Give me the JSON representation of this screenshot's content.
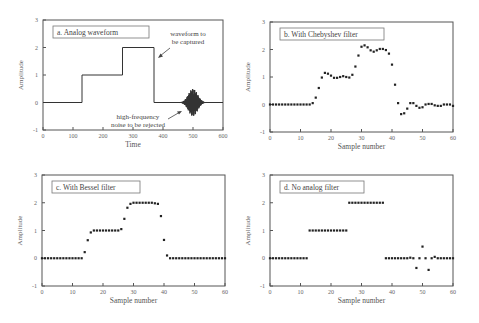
{
  "chart_data": [
    {
      "id": "a",
      "type": "line",
      "title": "a. Analog waveform",
      "xlabel": "Time",
      "ylabel": "Amplitude",
      "xlim": [
        0,
        600
      ],
      "ylim": [
        -1,
        3
      ],
      "xticks": [
        0,
        100,
        200,
        300,
        400,
        500,
        600
      ],
      "yticks": [
        -1,
        0,
        1,
        2,
        3
      ],
      "grid": false,
      "step_waveform": {
        "x": [
          0,
          130,
          130,
          265,
          265,
          370,
          370,
          600
        ],
        "y": [
          0,
          0,
          1,
          1,
          2,
          2,
          0,
          0
        ]
      },
      "noise_burst": {
        "center": 500,
        "halfwidth": 45,
        "peak_amplitude": 0.5
      },
      "annotations": [
        {
          "text_lines": [
            "waveform to",
            "be captured"
          ],
          "target": [
            370,
            1.8
          ]
        },
        {
          "text_lines": [
            "high-frequency",
            "noise to be rejected"
          ],
          "target": [
            460,
            0.0
          ]
        }
      ]
    },
    {
      "id": "b",
      "type": "scatter",
      "title": "b. With Chebyshev filter",
      "xlabel": "Sample number",
      "ylabel": "Amplitude",
      "xlim": [
        0,
        60
      ],
      "ylim": [
        -1,
        3
      ],
      "xticks": [
        0,
        10,
        20,
        30,
        40,
        50,
        60
      ],
      "yticks": [
        -1,
        0,
        1,
        2,
        3
      ],
      "x": [
        0,
        1,
        2,
        3,
        4,
        5,
        6,
        7,
        8,
        9,
        10,
        11,
        12,
        13,
        14,
        15,
        16,
        17,
        18,
        19,
        20,
        21,
        22,
        23,
        24,
        25,
        26,
        27,
        28,
        29,
        30,
        31,
        32,
        33,
        34,
        35,
        36,
        37,
        38,
        39,
        40,
        41,
        42,
        43,
        44,
        45,
        46,
        47,
        48,
        49,
        50,
        51,
        52,
        53,
        54,
        55,
        56,
        57,
        58,
        59,
        60
      ],
      "y": [
        0,
        0,
        0,
        0,
        0,
        0,
        0,
        0,
        0,
        0,
        0,
        0,
        0,
        0,
        0.05,
        0.25,
        0.6,
        0.98,
        1.15,
        1.12,
        1.05,
        0.97,
        0.97,
        1.0,
        1.03,
        1.0,
        0.98,
        1.08,
        1.38,
        1.78,
        2.1,
        2.15,
        2.08,
        1.97,
        1.92,
        1.97,
        2.02,
        2.02,
        1.98,
        1.85,
        1.45,
        0.72,
        0.05,
        -0.35,
        -0.32,
        -0.15,
        0.05,
        0.05,
        -0.05,
        -0.12,
        -0.1,
        0.0,
        0.02,
        0.02,
        -0.03,
        -0.05,
        -0.05,
        0.0,
        0.0,
        0.0,
        -0.05
      ]
    },
    {
      "id": "c",
      "type": "scatter",
      "title": "c. With Bessel filter",
      "xlabel": "Sample number",
      "ylabel": "Amplitude",
      "xlim": [
        0,
        60
      ],
      "ylim": [
        -1,
        3
      ],
      "xticks": [
        0,
        10,
        20,
        30,
        40,
        50,
        60
      ],
      "yticks": [
        -1,
        0,
        1,
        2,
        3
      ],
      "x": [
        0,
        1,
        2,
        3,
        4,
        5,
        6,
        7,
        8,
        9,
        10,
        11,
        12,
        13,
        14,
        15,
        16,
        17,
        18,
        19,
        20,
        21,
        22,
        23,
        24,
        25,
        26,
        27,
        28,
        29,
        30,
        31,
        32,
        33,
        34,
        35,
        36,
        37,
        38,
        39,
        40,
        41,
        42,
        43,
        44,
        45,
        46,
        47,
        48,
        49,
        50,
        51,
        52,
        53,
        54,
        55,
        56,
        57,
        58,
        59,
        60
      ],
      "y": [
        0,
        0,
        0,
        0,
        0,
        0,
        0,
        0,
        0,
        0,
        0,
        0,
        0,
        0,
        0.22,
        0.65,
        0.93,
        1.0,
        1.0,
        1.0,
        1.0,
        1.0,
        1.0,
        1.0,
        1.0,
        1.0,
        1.05,
        1.42,
        1.82,
        1.96,
        2.0,
        2.0,
        2.0,
        2.0,
        2.0,
        2.0,
        2.0,
        1.98,
        1.96,
        1.52,
        0.66,
        0.1,
        0.0,
        0,
        0,
        0,
        0,
        0,
        0,
        0,
        0,
        0,
        0,
        0,
        0,
        0,
        0,
        0,
        0,
        0,
        0
      ]
    },
    {
      "id": "d",
      "type": "scatter",
      "title": "d. No analog filter",
      "xlabel": "Sample number",
      "ylabel": "Amplitude",
      "xlim": [
        0,
        60
      ],
      "ylim": [
        -1,
        3
      ],
      "xticks": [
        0,
        10,
        20,
        30,
        40,
        50,
        60
      ],
      "yticks": [
        -1,
        0,
        1,
        2,
        3
      ],
      "x": [
        0,
        1,
        2,
        3,
        4,
        5,
        6,
        7,
        8,
        9,
        10,
        11,
        12,
        13,
        14,
        15,
        16,
        17,
        18,
        19,
        20,
        21,
        22,
        23,
        24,
        25,
        26,
        27,
        28,
        29,
        30,
        31,
        32,
        33,
        34,
        35,
        36,
        37,
        38,
        39,
        40,
        41,
        42,
        43,
        44,
        45,
        46,
        47,
        48,
        49,
        50,
        51,
        52,
        53,
        54,
        55,
        56,
        57,
        58,
        59,
        60
      ],
      "y": [
        0,
        0,
        0,
        0,
        0,
        0,
        0,
        0,
        0,
        0,
        0,
        0,
        0,
        1,
        1,
        1,
        1,
        1,
        1,
        1,
        1,
        1,
        1,
        1,
        1,
        1,
        2,
        2,
        2,
        2,
        2,
        2,
        2,
        2,
        2,
        2,
        2,
        2,
        0,
        0,
        0,
        0,
        0,
        0,
        0,
        0,
        0.02,
        0,
        -0.35,
        0,
        0.42,
        0,
        -0.42,
        0,
        0.05,
        0,
        0,
        0,
        0,
        0,
        0
      ]
    }
  ]
}
